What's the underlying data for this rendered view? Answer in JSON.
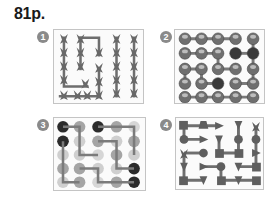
{
  "page": {
    "title": "81p."
  },
  "puzzles": [
    {
      "number": "1",
      "type": "butterfly-path-grid",
      "rows": 5,
      "cols": 5,
      "color": "#6b6b6b"
    },
    {
      "number": "2",
      "type": "ball-path-grid",
      "rows": 5,
      "cols": 5,
      "color": "#777777"
    },
    {
      "number": "3",
      "type": "dot-path-grid",
      "rows": 5,
      "cols": 5,
      "colors": {
        "dark": "#2b2b2b",
        "mid": "#9a9a9a",
        "light": "#cfcfcf"
      }
    },
    {
      "number": "4",
      "type": "shape-path-grid",
      "rows": 5,
      "cols": 5,
      "color": "#666666"
    }
  ]
}
